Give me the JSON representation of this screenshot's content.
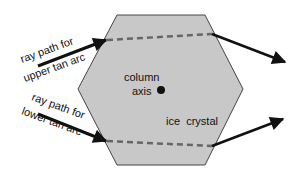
{
  "diagram": {
    "labels": {
      "upper_ray_line1": "ray path for",
      "upper_ray_line2": "upper tan arc",
      "lower_ray_line1": "ray path for",
      "lower_ray_line2": "lower tan arc",
      "column_line1": "column",
      "column_line2": "axis",
      "crystal": "ice  crystal"
    },
    "colors": {
      "crystal_fill": "#c8c8c8",
      "crystal_stroke": "#444444",
      "ray": "#111111",
      "dashed_path": "#666666"
    }
  }
}
